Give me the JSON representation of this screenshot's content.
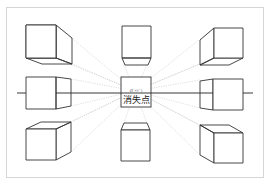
{
  "diagram": {
    "vanishing_point": {
      "label": "消失点",
      "sublabel": "(ｶﾞｲﾄﾞ)",
      "x": 135,
      "y": 91
    },
    "horizon_line": {
      "y": 93,
      "x1": 17,
      "x2": 253
    },
    "cubes": [
      {
        "position": "top-left",
        "view": "below-left of eye level"
      },
      {
        "position": "top-center",
        "view": "bottom face visible"
      },
      {
        "position": "top-right",
        "view": "bottom and left face visible"
      },
      {
        "position": "middle-left",
        "view": "right side face visible"
      },
      {
        "position": "middle-right",
        "view": "left side face visible"
      },
      {
        "position": "bottom-left",
        "view": "top and right face visible"
      },
      {
        "position": "bottom-center",
        "view": "top face visible"
      },
      {
        "position": "bottom-right",
        "view": "top and left face visible"
      }
    ],
    "colors": {
      "line": "#333333",
      "guide": "#bdbdbd",
      "frame": "#d6d6d6",
      "background": "#ffffff"
    }
  },
  "caption": ""
}
